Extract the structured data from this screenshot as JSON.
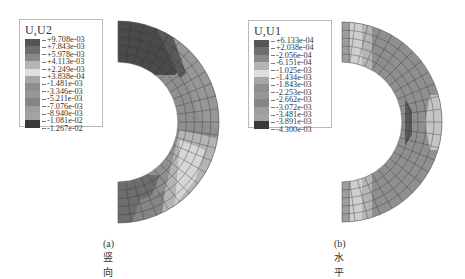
{
  "figure": {
    "panels": [
      {
        "id": "a",
        "caption": "(a) 竖向",
        "legend": {
          "title": "U,U2",
          "values": [
            "+9.708e-03",
            "+7.843e-03",
            "+5.978e-03",
            "+4.113e-03",
            "+2.249e-03",
            "+3.838e-04",
            "-1.481e-03",
            "-3.346e-03",
            "-5.211e-03",
            "-7.076e-03",
            "-8.940e-03",
            "-1.081e-02",
            "-1.267e-02"
          ],
          "colors": [
            "#555555",
            "#6e6e6e",
            "#8a8a8a",
            "#b4b4b4",
            "#dedede",
            "#a6a6a6",
            "#8f8f8f",
            "#979797",
            "#858585",
            "#9e9e9e",
            "#a3a3a3",
            "#3a3a3a",
            "#4a4a4a"
          ]
        }
      },
      {
        "id": "b",
        "caption": "(b) 水平",
        "legend": {
          "title": "U,U1",
          "values": [
            "+6.133e-04",
            "+2.038e-04",
            "-2.056e-04",
            "-6.151e-04",
            "-1.025e-03",
            "-1.434e-03",
            "-1.843e-03",
            "-2.253e-03",
            "-2.662e-03",
            "-3.072e-03",
            "-3.481e-03",
            "-3.891e-03",
            "-4.300e-03"
          ],
          "colors": [
            "#555555",
            "#6e6e6e",
            "#8a8a8a",
            "#b4b4b4",
            "#dedede",
            "#a6a6a6",
            "#8f8f8f",
            "#979797",
            "#858585",
            "#9e9e9e",
            "#a3a3a3",
            "#3a3a3a",
            "#4a4a4a"
          ]
        }
      }
    ]
  }
}
